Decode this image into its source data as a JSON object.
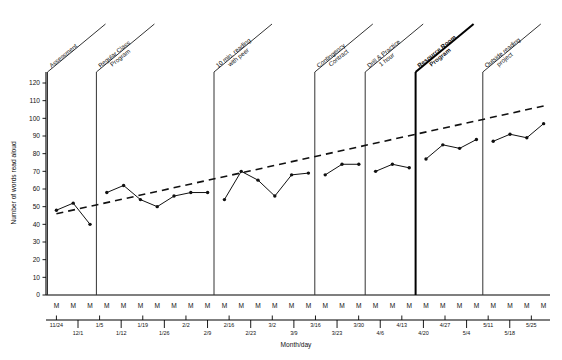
{
  "chart_data": {
    "type": "line",
    "title": "",
    "xlabel": "Month/day",
    "ylabel": "Number of words read aloud",
    "ylim": [
      0,
      130
    ],
    "yticks": [
      0,
      10,
      20,
      30,
      40,
      50,
      60,
      70,
      80,
      90,
      100,
      110,
      120
    ],
    "grid": false,
    "legend": "none",
    "session_label": "M",
    "session_count": 30,
    "x_tick_labels": [
      "11/24",
      "12/1",
      "1/5",
      "1/12",
      "1/19",
      "1/26",
      "2/2",
      "2/9",
      "2/16",
      "2/23",
      "3/2",
      "3/9",
      "3/16",
      "3/23",
      "3/30",
      "4/6",
      "4/13",
      "4/20",
      "4/27",
      "5/4",
      "5/11",
      "5/18",
      "5/25"
    ],
    "phases": [
      {
        "name": "Assessment",
        "bold": false,
        "start_index": 0,
        "end_index": 2
      },
      {
        "name": "Regular Class Program",
        "bold": false,
        "start_index": 3,
        "end_index": 9
      },
      {
        "name": "10 min. reading with peer",
        "bold": false,
        "start_index": 10,
        "end_index": 15
      },
      {
        "name": "Contingency Contract",
        "bold": false,
        "start_index": 16,
        "end_index": 18
      },
      {
        "name": "Drill & Practice 1 hour",
        "bold": false,
        "start_index": 19,
        "end_index": 21
      },
      {
        "name": "Resource Room Program",
        "bold": true,
        "start_index": 22,
        "end_index": 25
      },
      {
        "name": "Outside reading project",
        "bold": false,
        "start_index": 26,
        "end_index": 29
      }
    ],
    "series": [
      {
        "name": "Words read aloud",
        "style": "solid-with-markers",
        "x": [
          0,
          1,
          2,
          3,
          4,
          5,
          6,
          7,
          8,
          9,
          10,
          11,
          12,
          13,
          14,
          15,
          16,
          17,
          18,
          19,
          20,
          21,
          22,
          23,
          24,
          25,
          26,
          27,
          28,
          29
        ],
        "values": [
          48,
          52,
          40,
          58,
          62,
          54,
          50,
          56,
          58,
          58,
          54,
          70,
          65,
          56,
          68,
          69,
          68,
          74,
          74,
          70,
          74,
          72,
          77,
          85,
          83,
          88,
          87,
          91,
          89,
          97
        ]
      },
      {
        "name": "Trend line",
        "style": "dashed",
        "x": [
          0,
          29
        ],
        "values": [
          46,
          107
        ]
      }
    ]
  }
}
